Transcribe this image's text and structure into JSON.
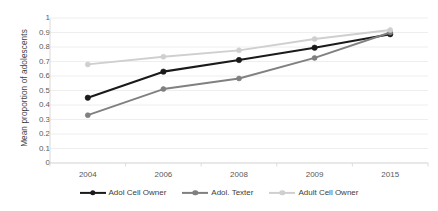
{
  "chart_data": {
    "type": "line",
    "title": "",
    "xlabel": "",
    "ylabel": "Mean proportion of adolescents",
    "categories": [
      "2004",
      "2006",
      "2008",
      "2009",
      "2015"
    ],
    "ylim": [
      0,
      1
    ],
    "yticks": [
      "0",
      "0.1",
      "0.2",
      "0.3",
      "0.4",
      "0.5",
      "0.6",
      "0.7",
      "0.8",
      "0.9",
      "1"
    ],
    "grid": true,
    "legend_position": "bottom",
    "series": [
      {
        "name": "Adol Cell Owner",
        "color": "#1a1a1a",
        "values": [
          0.45,
          0.63,
          0.71,
          0.795,
          0.888
        ]
      },
      {
        "name": "Adol. Texter",
        "color": "#808080",
        "values": [
          0.33,
          0.51,
          0.583,
          0.725,
          0.9
        ]
      },
      {
        "name": "Adult Cell Owner",
        "color": "#cfcfcf",
        "values": [
          0.68,
          0.733,
          0.777,
          0.855,
          0.917
        ]
      }
    ]
  },
  "axes": {
    "y_title": "Mean proportion of adolescents",
    "y_tick_labels": [
      "1",
      "0.9",
      "0.8",
      "0.7",
      "0.6",
      "0.5",
      "0.4",
      "0.3",
      "0.2",
      "0.1",
      "0"
    ],
    "x_tick_labels": [
      "2004",
      "2006",
      "2008",
      "2009",
      "2015"
    ]
  },
  "legend": {
    "items": [
      {
        "label": "Adol Cell Owner",
        "color": "#1a1a1a",
        "icon": "line-marker-icon"
      },
      {
        "label": "Adol. Texter",
        "color": "#808080",
        "icon": "line-marker-icon"
      },
      {
        "label": "Adult Cell Owner",
        "color": "#cfcfcf",
        "icon": "line-marker-icon"
      }
    ]
  },
  "style": {
    "grid_color": "#ececec",
    "axis_color": "#d9d9d9",
    "background": "#ffffff",
    "text_color": "#595959"
  }
}
